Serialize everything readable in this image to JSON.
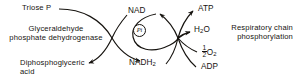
{
  "diagram": {
    "ink_color": "#16130f",
    "background_color": "#ffffff",
    "labels": {
      "triose_p": "Triose P",
      "enzyme_line1": "Glyceraldehyde",
      "enzyme_line2": "phosphate dehydrogenase",
      "diphospho_line1": "Diphosphoglyceric",
      "diphospho_line2": "acid",
      "nad": "NAD",
      "nadh2_base": "NADH",
      "nadh2_sub": "2",
      "pi": "Pi",
      "atp": "ATP",
      "h2o_base_a": "H",
      "h2o_sub": "2",
      "h2o_base_b": "O",
      "half_numerator": "1",
      "half_denominator": "2",
      "o2_base": "O",
      "o2_sub": "2",
      "adp": "ADP",
      "resp_line1": "Respiratory chain",
      "resp_line2": "phosphorylation"
    }
  }
}
